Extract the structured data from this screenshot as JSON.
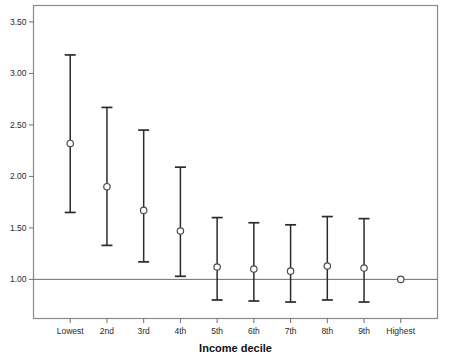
{
  "chart_data": {
    "type": "scatter",
    "title": "",
    "subtitle": "",
    "xlabel": "Income decile",
    "ylabel": "",
    "categories": [
      "Lowest",
      "2nd",
      "3rd",
      "4th",
      "5th",
      "6th",
      "7th",
      "8th",
      "9th",
      "Highest"
    ],
    "values": [
      2.32,
      1.9,
      1.67,
      1.47,
      1.12,
      1.1,
      1.08,
      1.13,
      1.11,
      1.0
    ],
    "error_low": [
      1.65,
      1.33,
      1.17,
      1.03,
      0.8,
      0.79,
      0.78,
      0.8,
      0.78,
      null
    ],
    "error_high": [
      3.18,
      2.67,
      2.45,
      2.09,
      1.6,
      1.55,
      1.53,
      1.61,
      1.59,
      null
    ],
    "reference_line": 1.0,
    "ylim": [
      0.62,
      3.66
    ],
    "xlim": [
      0,
      11
    ],
    "yticks": [
      1.0,
      1.5,
      2.0,
      2.5,
      3.0,
      3.5
    ],
    "ytick_labels": [
      "1.00",
      "1.50",
      "2.00",
      "2.50",
      "3.00",
      "3.50"
    ],
    "grid": false,
    "legend": "none",
    "marker": "open-circle"
  },
  "axes": {
    "x_title": "Income decile"
  },
  "colors": {
    "error_bar": "#2b2b2b",
    "marker_stroke": "#4a4a4a",
    "marker_fill": "#ffffff",
    "frame": "#8a8a8a",
    "reference_line": "#6f6f6f",
    "text": "#2a2a2a",
    "background": "#ffffff"
  }
}
